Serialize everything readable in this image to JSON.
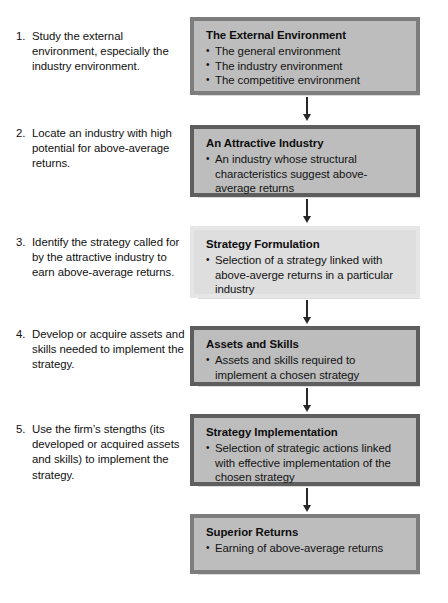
{
  "diagram": {
    "steps": [
      {
        "number": "1.",
        "text": "Study the external environment, especially the industry environment."
      },
      {
        "number": "2.",
        "text": "Locate an industry with high potential for above-average returns."
      },
      {
        "number": "3.",
        "text": "Identify the strategy called for by the attractive industry to earn above-average returns."
      },
      {
        "number": "4.",
        "text": "Develop or acquire assets and skills needed to implement the strategy."
      },
      {
        "number": "5.",
        "text": "Use the firm’s stengths (its developed or acquired assets and skills) to implement the strategy."
      }
    ],
    "boxes": [
      {
        "title": "The External Environment",
        "items": [
          "The general environment",
          "The industry environment",
          "The competitive environment"
        ],
        "fill": "#bdbdbd",
        "border": "#7d7d7d"
      },
      {
        "title": "An Attractive Industry",
        "items": [
          "An industry whose structural characteristics suggest above-average returns"
        ],
        "fill": "#bdbdbd",
        "border": "#5e5e5e"
      },
      {
        "title": "Strategy Formulation",
        "items": [
          "Selection of a strategy linked with above-averge returns in a particular industry"
        ],
        "fill": "#dedede",
        "border": "#e6e6e6"
      },
      {
        "title": "Assets and Skills",
        "items": [
          "Assets and skills required to implement a chosen strategy"
        ],
        "fill": "#bdbdbd",
        "border": "#5e5e5e"
      },
      {
        "title": "Strategy Implementation",
        "items": [
          "Selection of strategic actions linked with effective implementation of the chosen strategy"
        ],
        "fill": "#bdbdbd",
        "border": "#5e5e5e"
      },
      {
        "title": "Superior Returns",
        "items": [
          "Earning of above-average returns"
        ],
        "fill": "#bdbdbd",
        "border": "#7d7d7d"
      }
    ],
    "connectors": [
      {
        "name": "arrow-external-to-industry"
      },
      {
        "name": "arrow-industry-to-formulation"
      },
      {
        "name": "arrow-formulation-to-assets"
      },
      {
        "name": "arrow-assets-to-implementation"
      },
      {
        "name": "arrow-implementation-to-returns"
      }
    ]
  }
}
